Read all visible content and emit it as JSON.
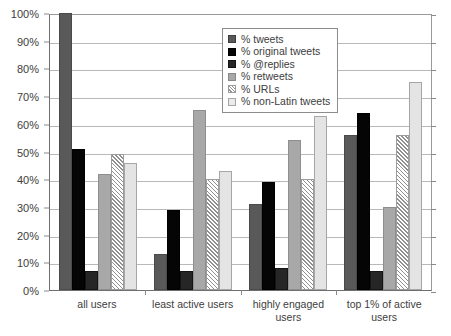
{
  "chart_data": {
    "type": "bar",
    "title": "",
    "subtitle": "",
    "xlabel": "",
    "ylabel": "",
    "ylim": [
      0,
      100
    ],
    "ytick_labels": [
      "100%",
      "90%",
      "80%",
      "70%",
      "60%",
      "50%",
      "40%",
      "30%",
      "20%",
      "10%",
      "0%"
    ],
    "ytick_values": [
      100,
      90,
      80,
      70,
      60,
      50,
      40,
      30,
      20,
      10,
      0
    ],
    "grid": true,
    "legend_position": "top-right-inside",
    "categories": [
      "all users",
      "least active users",
      "highly engaged users",
      "top 1% of active users"
    ],
    "series": [
      {
        "name": "% tweets",
        "values": [
          100,
          13,
          31,
          56
        ]
      },
      {
        "name": "% original tweets",
        "values": [
          51,
          29,
          39,
          64
        ]
      },
      {
        "name": "% @replies",
        "values": [
          7,
          7,
          8,
          7
        ]
      },
      {
        "name": "% retweets",
        "values": [
          42,
          65,
          54,
          30
        ]
      },
      {
        "name": "% URLs",
        "values": [
          49,
          40,
          40,
          56
        ]
      },
      {
        "name": "% non-Latin tweets",
        "values": [
          46,
          43,
          63,
          75
        ]
      }
    ]
  },
  "legend": {
    "items": [
      {
        "label": "% tweets"
      },
      {
        "label": "% original tweets"
      },
      {
        "label": "% @replies"
      },
      {
        "label": "% retweets"
      },
      {
        "label": "% URLs"
      },
      {
        "label": "% non-Latin tweets"
      }
    ]
  },
  "colors": {
    "tweets": "#595959",
    "original_tweets": "#050505",
    "replies": "#262626",
    "retweets": "#a8a8a8",
    "urls": "#f2f2f2",
    "non_latin_tweets": "#e4e4e4",
    "gridline": "#b9b9b9",
    "axis": "#6f6f6f",
    "text": "#3d3d3d",
    "background": "#ffffff"
  }
}
